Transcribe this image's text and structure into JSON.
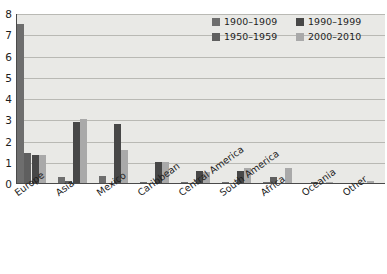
{
  "chart_data": {
    "type": "bar",
    "title": "",
    "xlabel": "",
    "ylabel": "",
    "ylim": [
      0,
      8
    ],
    "yticks": [
      0,
      1,
      2,
      3,
      4,
      5,
      6,
      7,
      8
    ],
    "grid": true,
    "legend_position": "top-right",
    "categories": [
      "Europe",
      "Asia",
      "Mexico",
      "Caribbean",
      "Central America",
      "South America",
      "Africa",
      "Oceania",
      "Other"
    ],
    "series": [
      {
        "name": "1900–1909",
        "color": "#6e6e6e",
        "values": [
          7.5,
          0.27,
          0.33,
          0.07,
          0.04,
          0.06,
          0.05,
          0.0,
          0.0
        ]
      },
      {
        "name": "1950–1959",
        "color": "#5f5f5f",
        "values": [
          1.4,
          0.1,
          0.0,
          0.0,
          0.0,
          0.0,
          0.27,
          0.03,
          0.0
        ]
      },
      {
        "name": "1990–1999",
        "color": "#474747",
        "values": [
          1.3,
          2.85,
          2.78,
          0.97,
          0.57,
          0.55,
          0.0,
          0.0,
          0.0
        ]
      },
      {
        "name": "2000–2010",
        "color": "#a9a9a9",
        "values": [
          1.3,
          3.0,
          1.55,
          1.0,
          0.51,
          0.7,
          0.7,
          0.03,
          0.1
        ]
      }
    ]
  },
  "legend": {
    "items": [
      {
        "label": "1900–1909",
        "color": "#6e6e6e",
        "icon": "legend-swatch-square"
      },
      {
        "label": "1990–1999",
        "color": "#474747",
        "icon": "legend-swatch-square"
      },
      {
        "label": "1950–1959",
        "color": "#5f5f5f",
        "icon": "legend-swatch-square"
      },
      {
        "label": "2000–2010",
        "color": "#a9a9a9",
        "icon": "legend-swatch-square"
      }
    ]
  },
  "axes": {
    "y_tick_labels": [
      "8",
      "7",
      "6",
      "5",
      "4",
      "3",
      "2",
      "1",
      "0"
    ],
    "x_tick_labels": [
      "Europe",
      "Asia",
      "Mexico",
      "Caribbean",
      "Central America",
      "South America",
      "Africa",
      "Oceania",
      "Other"
    ]
  },
  "colors": {
    "plot_background": "#e9e9e6",
    "page_background": "#ffffff",
    "gridline": "#b9b9b4",
    "axis": "#4a4a4a",
    "text": "#1d1d1d"
  }
}
